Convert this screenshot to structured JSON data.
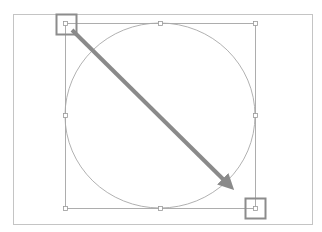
{
  "diagram": {
    "colors": {
      "background": "#ffffff",
      "frame": "#c4c4c4",
      "bounding_box": "#9a9a9a",
      "circle": "#a8a8a8",
      "handle": "#8c8c8c",
      "arrow": "#8a8a8a"
    },
    "frame": {
      "x": 13,
      "y": 14,
      "width": 299,
      "height": 210
    },
    "bounding_box": {
      "x": 65,
      "y": 23,
      "width": 190,
      "height": 185
    },
    "circle": {
      "cx": 160,
      "cy": 115.5,
      "rx": 95,
      "ry": 92.5
    },
    "anchor_points": [
      {
        "name": "top-left",
        "x": 65,
        "y": 23
      },
      {
        "name": "top-center",
        "x": 160,
        "y": 23
      },
      {
        "name": "top-right",
        "x": 255,
        "y": 23
      },
      {
        "name": "middle-left",
        "x": 65,
        "y": 115
      },
      {
        "name": "middle-right",
        "x": 255,
        "y": 115
      },
      {
        "name": "bottom-left",
        "x": 65,
        "y": 208
      },
      {
        "name": "bottom-center",
        "x": 160,
        "y": 208
      },
      {
        "name": "bottom-right",
        "x": 255,
        "y": 208
      }
    ],
    "highlight_handles": [
      {
        "name": "start-handle",
        "x": 56,
        "y": 14,
        "size": 20
      },
      {
        "name": "end-handle",
        "x": 245,
        "y": 198,
        "size": 20
      }
    ],
    "arrow": {
      "x1": 72,
      "y1": 30,
      "x2": 237,
      "y2": 193,
      "width": 4
    }
  }
}
